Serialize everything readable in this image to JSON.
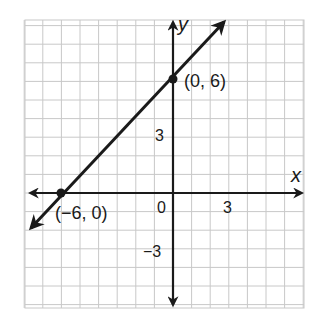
{
  "chart_data": {
    "type": "line",
    "title": "",
    "xlabel": "x",
    "ylabel": "y",
    "xlim": [
      -8,
      7
    ],
    "ylim": [
      -6,
      9
    ],
    "grid": true,
    "grid_step": 1,
    "x_ticks": [
      {
        "value": 0,
        "label": "0"
      },
      {
        "value": 3,
        "label": "3"
      }
    ],
    "y_ticks": [
      {
        "value": 3,
        "label": "3"
      },
      {
        "value": -3,
        "label": "−3"
      }
    ],
    "series": [
      {
        "name": "line",
        "equation": "y = x + 6",
        "slope": 1,
        "intercept": 6,
        "x": [
          -6,
          0
        ],
        "y": [
          0,
          6
        ],
        "arrows": "both"
      }
    ],
    "points": [
      {
        "x": -6,
        "y": 0,
        "label": "(−6, 0)"
      },
      {
        "x": 0,
        "y": 6,
        "label": "(0, 6)"
      }
    ]
  },
  "labels": {
    "x_axis": "x",
    "y_axis": "y",
    "origin": "0",
    "x_tick_3": "3",
    "y_tick_3": "3",
    "y_tick_neg3": "−3",
    "point_a": "(−6, 0)",
    "point_b": "(0, 6)"
  },
  "colors": {
    "grid": "#c8c8c8",
    "axis": "#1a1a1a",
    "line": "#1a1a1a",
    "background": "#ffffff"
  }
}
